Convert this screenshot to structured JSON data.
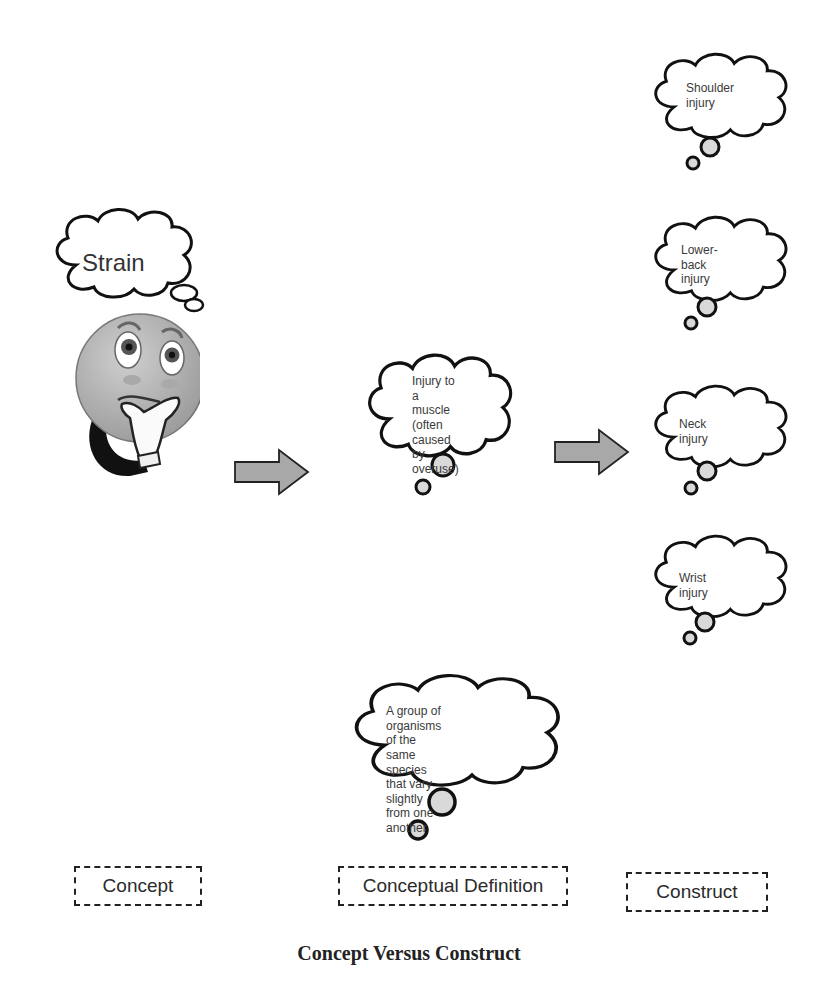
{
  "figure": {
    "caption": "Concept Versus Construct",
    "colors": {
      "outline": "#111111",
      "arrow_fill": "#a8a8a8",
      "face_fill": "#b4b4b4",
      "bubble_fill": "#ffffff",
      "small_bubble_fill": "#d9d9d9"
    }
  },
  "concept": {
    "thought": "Strain",
    "character_icon": "thinking-face-icon",
    "label": "Concept"
  },
  "conceptual_definition": {
    "primary": [
      "Injury to a",
      "muscle (often",
      "caused by",
      "overuse)"
    ],
    "alternate": [
      "A group of organisms",
      "of the same species",
      "that vary slightly",
      "from one another"
    ],
    "label": "Conceptual Definition"
  },
  "constructs": {
    "items": [
      "Shoulder injury",
      "Lower-back injury",
      "Neck injury",
      "Wrist injury"
    ],
    "lines": [
      [
        "Shoulder",
        "injury"
      ],
      [
        "Lower-back",
        "injury"
      ],
      [
        "Neck injury"
      ],
      [
        "Wrist injury"
      ]
    ],
    "label": "Construct"
  },
  "arrows": [
    "arrow-right-icon",
    "arrow-right-icon"
  ]
}
